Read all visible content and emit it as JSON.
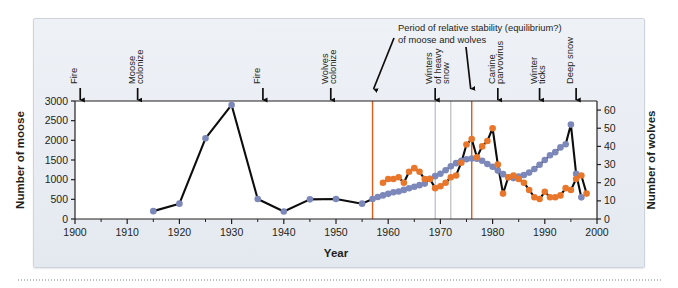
{
  "figure": {
    "background_color": "#e9edf3",
    "plot_background": "#ffffff"
  },
  "chart_data": {
    "type": "line",
    "title": "",
    "subtitle": "",
    "xlabel": "Year",
    "ylabel": "Number of moose",
    "y2label": "Number of wolves",
    "xlim": [
      1900,
      2000
    ],
    "ylim": [
      0,
      3000
    ],
    "y2lim": [
      0,
      65
    ],
    "grid": false,
    "legend_position": "none",
    "xticks": [
      1900,
      1910,
      1920,
      1930,
      1940,
      1950,
      1960,
      1970,
      1980,
      1990,
      2000
    ],
    "xtick_labels": [
      "1900",
      "1910",
      "1920",
      "1930",
      "1940",
      "1950",
      "1960",
      "1970",
      "1980",
      "1990",
      "2000"
    ],
    "yticks": [
      0,
      500,
      1000,
      1500,
      2000,
      2500,
      3000
    ],
    "ytick_labels": [
      "0",
      "500",
      "1000",
      "1500",
      "2000",
      "2500",
      "3000"
    ],
    "y2ticks": [
      0,
      10,
      20,
      30,
      40,
      50,
      60
    ],
    "y2tick_labels": [
      "0",
      "10",
      "20",
      "30",
      "40",
      "50",
      "60"
    ],
    "series": [
      {
        "name": "Number of moose",
        "axis": "left",
        "color": "#7d88ba",
        "marker": "circle",
        "points": [
          [
            1915,
            200
          ],
          [
            1920,
            390
          ],
          [
            1925,
            2050
          ],
          [
            1930,
            2900
          ],
          [
            1935,
            510
          ],
          [
            1940,
            190
          ],
          [
            1945,
            500
          ],
          [
            1950,
            510
          ],
          [
            1955,
            390
          ],
          [
            1957,
            510
          ],
          [
            1958,
            560
          ],
          [
            1959,
            600
          ],
          [
            1960,
            640
          ],
          [
            1961,
            680
          ],
          [
            1962,
            700
          ],
          [
            1963,
            740
          ],
          [
            1964,
            780
          ],
          [
            1965,
            820
          ],
          [
            1966,
            860
          ],
          [
            1967,
            900
          ],
          [
            1968,
            1020
          ],
          [
            1969,
            1090
          ],
          [
            1970,
            1150
          ],
          [
            1971,
            1240
          ],
          [
            1972,
            1340
          ],
          [
            1973,
            1420
          ],
          [
            1974,
            1480
          ],
          [
            1975,
            1520
          ],
          [
            1976,
            1540
          ],
          [
            1977,
            1530
          ],
          [
            1978,
            1480
          ],
          [
            1979,
            1400
          ],
          [
            1980,
            1330
          ],
          [
            1981,
            1230
          ],
          [
            1982,
            1140
          ],
          [
            1983,
            1060
          ],
          [
            1984,
            1040
          ],
          [
            1985,
            1080
          ],
          [
            1986,
            1120
          ],
          [
            1987,
            1180
          ],
          [
            1988,
            1270
          ],
          [
            1989,
            1380
          ],
          [
            1990,
            1500
          ],
          [
            1991,
            1620
          ],
          [
            1992,
            1700
          ],
          [
            1993,
            1820
          ],
          [
            1994,
            1900
          ],
          [
            1995,
            2400
          ],
          [
            1996,
            1150
          ],
          [
            1997,
            550
          ]
        ]
      },
      {
        "name": "Number of wolves",
        "axis": "right",
        "color": "#e8772c",
        "marker": "circle",
        "points": [
          [
            1959,
            20
          ],
          [
            1960,
            22
          ],
          [
            1961,
            22
          ],
          [
            1962,
            23
          ],
          [
            1963,
            20
          ],
          [
            1964,
            26
          ],
          [
            1965,
            28
          ],
          [
            1966,
            26
          ],
          [
            1967,
            22
          ],
          [
            1968,
            22
          ],
          [
            1969,
            17
          ],
          [
            1970,
            18
          ],
          [
            1971,
            20
          ],
          [
            1972,
            23
          ],
          [
            1973,
            24
          ],
          [
            1974,
            31
          ],
          [
            1975,
            41
          ],
          [
            1976,
            44
          ],
          [
            1977,
            34
          ],
          [
            1978,
            40
          ],
          [
            1979,
            43
          ],
          [
            1980,
            50
          ],
          [
            1981,
            30
          ],
          [
            1982,
            14
          ],
          [
            1983,
            23
          ],
          [
            1984,
            24
          ],
          [
            1985,
            22
          ],
          [
            1986,
            20
          ],
          [
            1987,
            16
          ],
          [
            1988,
            12
          ],
          [
            1989,
            11
          ],
          [
            1990,
            15
          ],
          [
            1991,
            12
          ],
          [
            1992,
            12
          ],
          [
            1993,
            13
          ],
          [
            1994,
            17
          ],
          [
            1995,
            16
          ],
          [
            1996,
            22
          ],
          [
            1997,
            24
          ],
          [
            1998,
            14
          ]
        ]
      }
    ],
    "event_markers": [
      {
        "label": "Fire",
        "year": 1901,
        "lines": [
          "Fire"
        ]
      },
      {
        "label": "Moose colonize",
        "year": 1912,
        "lines": [
          "Moose",
          "colonize"
        ]
      },
      {
        "label": "Fire",
        "year": 1936,
        "lines": [
          "Fire"
        ]
      },
      {
        "label": "Wolves colonize",
        "year": 1949,
        "lines": [
          "Wolves",
          "colonize"
        ]
      },
      {
        "label": "Winters of heavy snow",
        "year": 1969,
        "lines": [
          "Winters",
          "of heavy",
          "snow"
        ]
      },
      {
        "label": "Canine parvovirus",
        "year": 1981,
        "lines": [
          "Canine",
          "parvovirus"
        ]
      },
      {
        "label": "Winter ticks",
        "year": 1989,
        "lines": [
          "Winter",
          "ticks"
        ]
      },
      {
        "label": "Deep snow",
        "year": 1996,
        "lines": [
          "Deep snow"
        ]
      }
    ],
    "annotation": {
      "text_lines": [
        "Period of relative stability (equilibrium?)",
        "of moose and wolves"
      ],
      "span_start_year": 1957,
      "span_end_year": 1976,
      "span_line_color": "#e05a1e"
    },
    "reference_lines_gray": [
      1969,
      1972
    ],
    "reference_lines_orange": [
      1957,
      1976
    ]
  }
}
